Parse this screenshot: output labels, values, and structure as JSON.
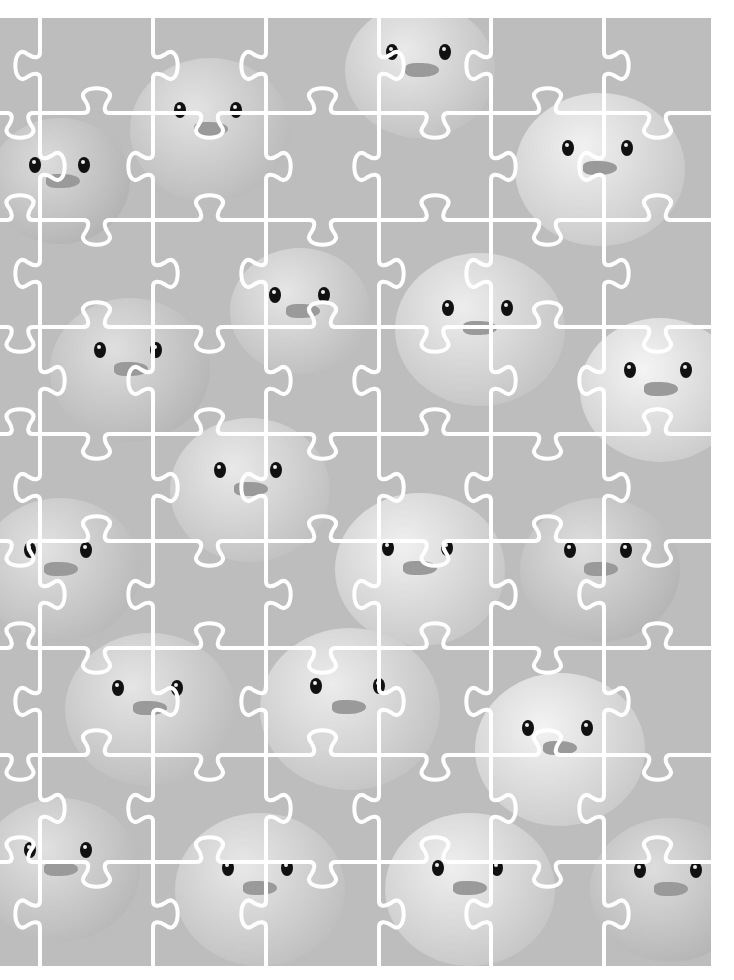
{
  "image": {
    "description": "Grayscale photo of many rubber ducks overlaid with a white jigsaw-puzzle cut pattern",
    "content_box": {
      "x": 0,
      "y": 18,
      "width": 711,
      "height": 948
    },
    "background_color": "#ffffff",
    "photo_base_color": "#bdbdbd"
  },
  "puzzle": {
    "line_color": "#ffffff",
    "line_width": 4,
    "columns": 7,
    "rows": 9,
    "vertical_lines_x": [
      40,
      153,
      266,
      379,
      491,
      604
    ],
    "horizontal_lines_y": [
      95,
      202,
      309,
      416,
      523,
      630,
      737,
      844
    ],
    "tab_radius": 17
  },
  "ducks": [
    {
      "x": 60,
      "y": 170,
      "r": 70
    },
    {
      "x": 210,
      "y": 120,
      "r": 80
    },
    {
      "x": 420,
      "y": 60,
      "r": 75
    },
    {
      "x": 600,
      "y": 160,
      "r": 85
    },
    {
      "x": 130,
      "y": 360,
      "r": 80
    },
    {
      "x": 300,
      "y": 300,
      "r": 70
    },
    {
      "x": 480,
      "y": 320,
      "r": 85
    },
    {
      "x": 660,
      "y": 380,
      "r": 80
    },
    {
      "x": 60,
      "y": 560,
      "r": 80
    },
    {
      "x": 250,
      "y": 480,
      "r": 80
    },
    {
      "x": 420,
      "y": 560,
      "r": 85
    },
    {
      "x": 600,
      "y": 560,
      "r": 80
    },
    {
      "x": 150,
      "y": 700,
      "r": 85
    },
    {
      "x": 350,
      "y": 700,
      "r": 90
    },
    {
      "x": 560,
      "y": 740,
      "r": 85
    },
    {
      "x": 60,
      "y": 860,
      "r": 80
    },
    {
      "x": 260,
      "y": 880,
      "r": 85
    },
    {
      "x": 470,
      "y": 880,
      "r": 85
    },
    {
      "x": 670,
      "y": 880,
      "r": 80
    }
  ]
}
